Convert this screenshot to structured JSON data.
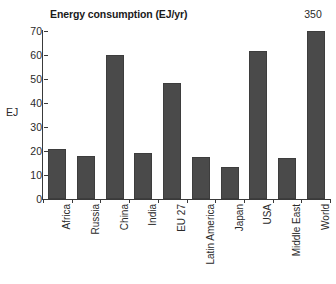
{
  "chart_data": {
    "type": "bar",
    "title": "Energy consumption (EJ/yr)",
    "xlabel": "",
    "ylabel": "EJ",
    "ylim": [
      0,
      70
    ],
    "yticks": [
      0,
      10,
      20,
      30,
      40,
      50,
      60,
      70
    ],
    "grid": false,
    "legend": null,
    "bar_color": "#4a4a4a",
    "categories": [
      "Africa",
      "Russia",
      "China",
      "India",
      "EU 27",
      "Latin America",
      "Japan",
      "USA",
      "Middle East",
      "World"
    ],
    "values": [
      21,
      17.8,
      60,
      19.2,
      48.5,
      17.5,
      13.5,
      61.5,
      17,
      350
    ],
    "annotations": [
      {
        "text": "350",
        "category": "World",
        "note": "value label above clipped bar"
      }
    ],
    "clipped_bars": [
      {
        "category": "World",
        "actual_value": 350,
        "drawn_to": 70
      }
    ]
  }
}
